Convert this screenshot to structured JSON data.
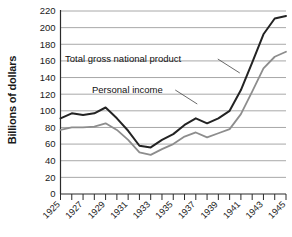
{
  "chart_data": {
    "type": "line",
    "title": "",
    "xlabel": "",
    "ylabel": "Billions of dollars",
    "xlim": [
      1925,
      1945
    ],
    "ylim": [
      0,
      220
    ],
    "ytick_step": 20,
    "yticks": [
      0,
      20,
      40,
      60,
      80,
      100,
      120,
      140,
      160,
      180,
      200,
      220
    ],
    "ytick_labels": [
      "0",
      "20",
      "40",
      "60",
      "80",
      "100",
      "120",
      "140",
      "160",
      "180",
      "200",
      "220"
    ],
    "x": [
      1925,
      1926,
      1927,
      1928,
      1929,
      1930,
      1931,
      1932,
      1933,
      1934,
      1935,
      1936,
      1937,
      1938,
      1939,
      1940,
      1941,
      1942,
      1943,
      1944,
      1945
    ],
    "xticks": [
      1925,
      1926,
      1927,
      1928,
      1929,
      1930,
      1931,
      1932,
      1933,
      1934,
      1935,
      1936,
      1937,
      1938,
      1939,
      1940,
      1941,
      1942,
      1943,
      1944,
      1945
    ],
    "xtick_labels": [
      "1925",
      "",
      "1927",
      "",
      "1929",
      "",
      "1931",
      "",
      "1933",
      "",
      "1935",
      "",
      "1937",
      "",
      "1939",
      "",
      "1941",
      "",
      "1943",
      "",
      "1945"
    ],
    "grid": true,
    "grid_axis": "y",
    "legend": "annotations-on-plot",
    "series": [
      {
        "name": "Total gross national product",
        "color": "#232323",
        "width": 2.0,
        "values": [
          91,
          97,
          95,
          97,
          104,
          91,
          76,
          58,
          56,
          65,
          72,
          83,
          91,
          85,
          91,
          100,
          125,
          158,
          192,
          211,
          214
        ]
      },
      {
        "name": "Personal income",
        "color": "#8d8d8d",
        "width": 1.8,
        "values": [
          77,
          80,
          80,
          81,
          85,
          77,
          65,
          50,
          47,
          54,
          60,
          69,
          74,
          68,
          73,
          78,
          96,
          123,
          151,
          165,
          171
        ]
      }
    ],
    "annotations": [
      {
        "text": "Total gross national product",
        "x_px": 65,
        "y_px": 62,
        "leader": "from label right edge down-right to GNP line near 1941"
      },
      {
        "text": "Personal income",
        "x_px": 92,
        "y_px": 93,
        "leader": "from label right edge down-right to Personal income line near 1940"
      }
    ]
  }
}
